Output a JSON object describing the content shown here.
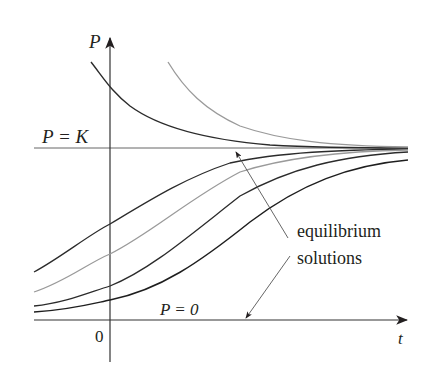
{
  "figure": {
    "y_axis_label": "P",
    "x_axis_label": "t",
    "origin_label": "0",
    "carrying_capacity_label": "P = K",
    "zero_label": "P = 0",
    "annotation": {
      "line1": "equilibrium",
      "line2": "solutions"
    }
  },
  "colors": {
    "ink": "#231f20",
    "light_curve": "#9a9a9a",
    "dark_curve": "#2b2b2b",
    "axis": "#333333"
  },
  "curves": [
    {
      "name": "above-K-dark",
      "shade": "dark",
      "start_above_K": true
    },
    {
      "name": "above-K-light",
      "shade": "light",
      "start_above_K": true
    },
    {
      "name": "below-K-1",
      "shade": "dark"
    },
    {
      "name": "below-K-2",
      "shade": "light"
    },
    {
      "name": "below-K-3",
      "shade": "dark"
    },
    {
      "name": "below-K-4",
      "shade": "dark"
    }
  ]
}
